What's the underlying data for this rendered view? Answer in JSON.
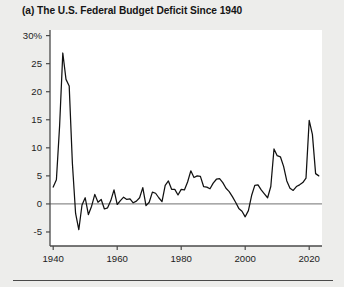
{
  "figure": {
    "panel_label": "(a)",
    "title": "(a) The U.S. Federal Budget Deficit Since 1940",
    "background_color": "#ededeb",
    "plot_background_color": "#ffffff",
    "line_color": "#111111",
    "zero_line_color": "#888888",
    "axis_color": "#4a4a4a"
  },
  "chart_data": {
    "type": "line",
    "title": "(a) The U.S. Federal Budget Deficit Since 1940",
    "xlabel": "",
    "ylabel": "",
    "xlim": [
      1939,
      2024
    ],
    "ylim": [
      -7.5,
      31
    ],
    "grid": false,
    "legend": null,
    "y_tick_labels": [
      "30%",
      "25",
      "20",
      "15",
      "10",
      "5",
      "0",
      "-5"
    ],
    "y_ticks": [
      30,
      25,
      20,
      15,
      10,
      5,
      0,
      -5
    ],
    "x_tick_labels": [
      "1940",
      "1960",
      "1980",
      "2000",
      "2020"
    ],
    "x_ticks": [
      1940,
      1960,
      1980,
      2000,
      2020
    ],
    "zero_reference_line": 0,
    "series": [
      {
        "name": "Federal budget deficit (% of GDP)",
        "x": [
          1940,
          1941,
          1942,
          1943,
          1944,
          1945,
          1946,
          1947,
          1948,
          1949,
          1950,
          1951,
          1952,
          1953,
          1954,
          1955,
          1956,
          1957,
          1958,
          1959,
          1960,
          1961,
          1962,
          1963,
          1964,
          1965,
          1966,
          1967,
          1968,
          1969,
          1970,
          1971,
          1972,
          1973,
          1974,
          1975,
          1976,
          1977,
          1978,
          1979,
          1980,
          1981,
          1982,
          1983,
          1984,
          1985,
          1986,
          1987,
          1988,
          1989,
          1990,
          1991,
          1992,
          1993,
          1994,
          1995,
          1996,
          1997,
          1998,
          1999,
          2000,
          2001,
          2002,
          2003,
          2004,
          2005,
          2006,
          2007,
          2008,
          2009,
          2010,
          2011,
          2012,
          2013,
          2014,
          2015,
          2016,
          2017,
          2018,
          2019,
          2020,
          2021,
          2022,
          2023
        ],
        "values": [
          3.0,
          4.3,
          13.9,
          26.9,
          22.2,
          21.0,
          7.2,
          -1.7,
          -4.6,
          -0.2,
          1.1,
          -1.9,
          -0.4,
          1.7,
          0.3,
          0.8,
          -0.9,
          -0.7,
          0.6,
          2.5,
          -0.1,
          0.6,
          1.2,
          0.8,
          0.9,
          0.2,
          0.5,
          1.1,
          2.9,
          -0.3,
          0.3,
          2.1,
          1.9,
          1.1,
          0.4,
          3.3,
          4.1,
          2.6,
          2.6,
          1.6,
          2.6,
          2.5,
          3.9,
          5.9,
          4.7,
          5.0,
          4.9,
          3.1,
          3.0,
          2.7,
          3.7,
          4.4,
          4.5,
          3.8,
          2.8,
          2.2,
          1.3,
          0.3,
          -0.8,
          -1.3,
          -2.3,
          -1.2,
          1.5,
          3.3,
          3.4,
          2.5,
          1.8,
          1.1,
          3.1,
          9.8,
          8.6,
          8.4,
          6.7,
          4.1,
          2.8,
          2.4,
          3.1,
          3.4,
          3.8,
          4.6,
          14.9,
          12.4,
          5.4,
          5.0
        ],
        "units": "percent of GDP"
      }
    ]
  }
}
